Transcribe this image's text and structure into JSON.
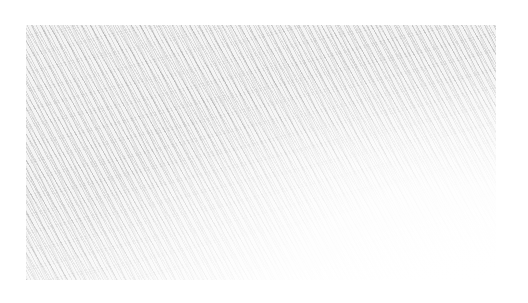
{
  "image": {
    "description": "pencil hatching texture",
    "background_color": "#ffffff",
    "texture_color": "#5a5a5a"
  }
}
